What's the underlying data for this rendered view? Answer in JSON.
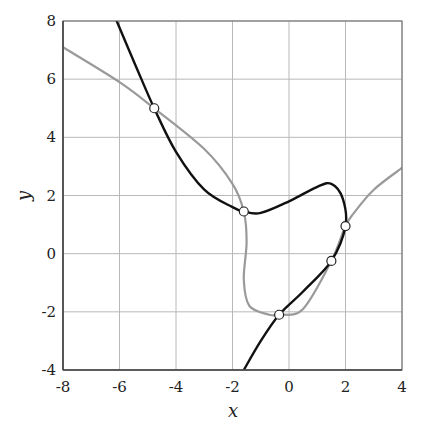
{
  "chart_data": {
    "type": "line",
    "title": "",
    "xlabel": "x",
    "ylabel": "y",
    "xlim": [
      -8,
      4
    ],
    "ylim": [
      -4,
      8
    ],
    "grid": true,
    "legend": null,
    "x_ticks": [
      "-8",
      "-6",
      "-4",
      "-2",
      "0",
      "2",
      "4"
    ],
    "y_ticks": [
      "-4",
      "-2",
      "0",
      "2",
      "4",
      "6",
      "8"
    ],
    "series": [
      {
        "name": "black curve",
        "color": "#111111",
        "points": [
          [
            -6.1,
            8.0
          ],
          [
            -5.4,
            6.4
          ],
          [
            -4.77,
            5.0
          ],
          [
            -4.0,
            3.5
          ],
          [
            -3.0,
            2.2
          ],
          [
            -2.0,
            1.6
          ],
          [
            -1.6,
            1.45
          ],
          [
            -1.0,
            1.4
          ],
          [
            0.0,
            1.8
          ],
          [
            1.0,
            2.3
          ],
          [
            1.5,
            2.4
          ],
          [
            1.9,
            1.9
          ],
          [
            2.0,
            0.95
          ],
          [
            1.5,
            -0.25
          ],
          [
            0.5,
            -1.3
          ],
          [
            -0.35,
            -2.1
          ],
          [
            -1.0,
            -3.0
          ],
          [
            -1.6,
            -4.0
          ]
        ]
      },
      {
        "name": "grey curve",
        "color": "#9a9a9a",
        "points": [
          [
            -8.0,
            7.1
          ],
          [
            -6.0,
            5.9
          ],
          [
            -4.77,
            5.0
          ],
          [
            -3.0,
            3.6
          ],
          [
            -2.0,
            2.4
          ],
          [
            -1.6,
            1.45
          ],
          [
            -1.5,
            0.4
          ],
          [
            -1.6,
            -0.9
          ],
          [
            -1.4,
            -1.8
          ],
          [
            -0.7,
            -2.1
          ],
          [
            -0.35,
            -2.1
          ],
          [
            0.5,
            -1.9
          ],
          [
            1.5,
            -0.25
          ],
          [
            2.0,
            0.95
          ],
          [
            2.3,
            1.4
          ],
          [
            3.0,
            2.2
          ],
          [
            4.0,
            2.95
          ]
        ]
      }
    ],
    "intersection_markers": [
      {
        "x": -4.77,
        "y": 5.0
      },
      {
        "x": -1.6,
        "y": 1.45
      },
      {
        "x": 2.0,
        "y": 0.95
      },
      {
        "x": 1.5,
        "y": -0.25
      },
      {
        "x": -0.35,
        "y": -2.1
      }
    ]
  }
}
